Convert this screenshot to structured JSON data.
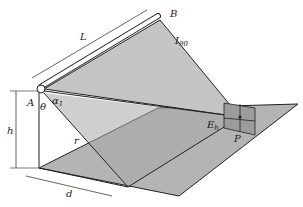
{
  "diagram": {
    "type": "linear-luminaire-illuminance-geometry",
    "labels": {
      "luminaire_length": "L",
      "end_a": "A",
      "end_b": "B",
      "intensity": "I",
      "intensity_sub": "90",
      "alpha": "α",
      "alpha_sub": "1",
      "theta": "θ",
      "distance_r": "r",
      "height": "h",
      "horizontal_distance": "d",
      "illuminance": "E",
      "illuminance_sub": "h",
      "point": "P"
    },
    "colors": {
      "background": "#ffffff",
      "plane_fill": "#b4b4b4",
      "light_triangle_fill": "#c4c4c4",
      "dark_triangle_fill": "#a8a8a8",
      "vertical_plane_fill": "#9c9c9c",
      "line": "#222222"
    }
  }
}
